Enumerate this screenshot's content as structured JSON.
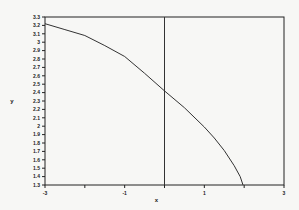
{
  "chart_data": {
    "type": "line",
    "title": "",
    "xlabel": "x",
    "ylabel": "y",
    "xlim": [
      -3,
      3
    ],
    "ylim": [
      1.3,
      3.3
    ],
    "grid": false,
    "legend": null,
    "x_ticks": [
      -3,
      -2,
      -1,
      0,
      1,
      2,
      3
    ],
    "x_tick_labels": [
      "-3",
      "",
      "-1",
      "",
      "1",
      "",
      "3"
    ],
    "y_ticks": [
      3.3,
      3.2,
      3.1,
      3,
      2.9,
      2.8,
      2.7,
      2.6,
      2.5,
      2.4,
      2.3,
      2.2,
      2.1,
      2,
      1.9,
      1.8,
      1.7,
      1.6,
      1.5,
      1.4,
      1.3
    ],
    "y_tick_labels": [
      "3.3",
      "3.2",
      "3.1",
      "3",
      "2.9",
      "2.8",
      "2.7",
      "2.6",
      "2.5",
      "2.4",
      "2.3",
      "2.2",
      "2.1",
      "2",
      "1.9",
      "1.8",
      "1.7",
      "1.6",
      "1.5",
      "1.4",
      "1.3"
    ],
    "vertical_line": {
      "x": 0
    },
    "series": [
      {
        "name": "curve",
        "x": [
          -3,
          -2.5,
          -2,
          -1.5,
          -1,
          -0.5,
          0,
          0.5,
          1,
          1.25,
          1.5,
          1.75,
          1.9,
          1.97
        ],
        "y": [
          3.22,
          3.15,
          3.08,
          2.96,
          2.83,
          2.63,
          2.42,
          2.22,
          1.99,
          1.86,
          1.71,
          1.53,
          1.4,
          1.3
        ]
      }
    ]
  },
  "colors": {
    "background": "#f7f7f5",
    "axis": "#222222",
    "line": "#333333"
  }
}
